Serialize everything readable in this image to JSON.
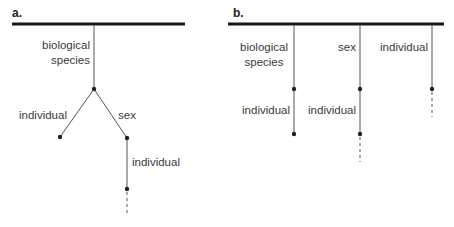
{
  "panels": {
    "a": {
      "label": "a.",
      "nodes": {
        "root_stem": "biological species",
        "root_stem_line1": "biological",
        "root_stem_line2": "species",
        "left_branch": "individual",
        "right_branch": "sex",
        "right_child": "individual"
      }
    },
    "b": {
      "label": "b.",
      "columns": [
        {
          "top_line1": "biological",
          "top_line2": "species",
          "bottom": "individual",
          "continues": false
        },
        {
          "top_line1": "sex",
          "top_line2": "",
          "bottom": "individual",
          "continues": true
        },
        {
          "top_line1": "individual",
          "top_line2": "",
          "bottom": "",
          "continues": true
        }
      ]
    }
  },
  "colors": {
    "line": "#2a2a2a",
    "text": "#3a3a3a",
    "bar": "#1a1a1a"
  }
}
